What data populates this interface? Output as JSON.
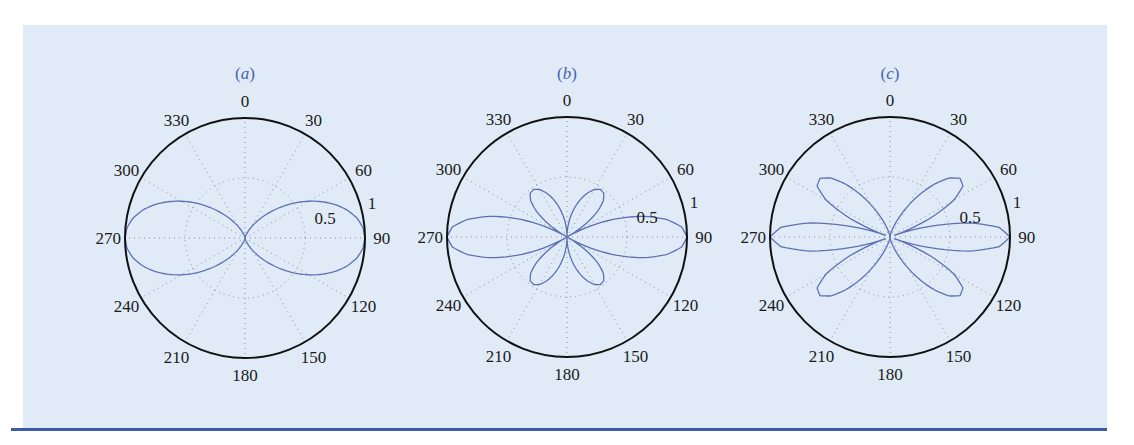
{
  "figure": {
    "background_color": "#e0ebf7",
    "rule_color": "#3f5ca3",
    "curve_color": "#5c70b4",
    "axis_color": "#111111",
    "grid_color": "#8a8f99"
  },
  "chart_data": [
    {
      "type": "polar",
      "title": "(a)",
      "title_letter": "a",
      "orientation": "compass (0 at top, clockwise)",
      "angle_ticks": [
        "0",
        "30",
        "60",
        "90",
        "120",
        "150",
        "180",
        "210",
        "240",
        "270",
        "300",
        "330"
      ],
      "radial_ticks": [
        "0.5",
        "1"
      ],
      "rlim": [
        0,
        1
      ],
      "grid": true,
      "theta_step_deg": 5,
      "theta_0_90": [
        0,
        5,
        10,
        15,
        20,
        25,
        30,
        35,
        40,
        45,
        50,
        55,
        60,
        65,
        70,
        75,
        80,
        85,
        90
      ],
      "r_0_90": [
        0,
        0.0005,
        0.0041,
        0.0138,
        0.0324,
        0.062,
        0.1045,
        0.1607,
        0.2309,
        0.314,
        0.4078,
        0.5096,
        0.6124,
        0.7139,
        0.8073,
        0.8872,
        0.9484,
        0.9868,
        1
      ],
      "symmetry": "r(180-θ)=r(θ), r(θ+180)=r(θ)"
    },
    {
      "type": "polar",
      "title": "(b)",
      "title_letter": "b",
      "orientation": "compass (0 at top, clockwise)",
      "angle_ticks": [
        "0",
        "30",
        "60",
        "90",
        "120",
        "150",
        "180",
        "210",
        "240",
        "270",
        "300",
        "330"
      ],
      "radial_ticks": [
        "0.5",
        "1"
      ],
      "rlim": [
        0,
        1
      ],
      "grid": true,
      "theta_step_deg": 5,
      "theta_0_90": [
        0,
        5,
        10,
        15,
        20,
        25,
        30,
        35,
        40,
        45,
        50,
        55,
        60,
        65,
        70,
        75,
        80,
        85,
        90
      ],
      "r_0_90": [
        0,
        0.0872,
        0.1731,
        0.2573,
        0.3359,
        0.4044,
        0.4563,
        0.4835,
        0.4768,
        0.4283,
        0.332,
        0.1878,
        0,
        0.2181,
        0.4479,
        0.6639,
        0.8419,
        0.959,
        1
      ],
      "symmetry": "r(180-θ)=r(θ), r(θ+180)=r(θ)"
    },
    {
      "type": "polar",
      "title": "(c)",
      "title_letter": "c",
      "orientation": "compass (0 at top, clockwise)",
      "angle_ticks": [
        "0",
        "30",
        "60",
        "90",
        "120",
        "150",
        "180",
        "210",
        "240",
        "270",
        "300",
        "330"
      ],
      "radial_ticks": [
        "0.5",
        "1"
      ],
      "rlim": [
        0,
        1
      ],
      "grid": true,
      "theta_step_deg": 5,
      "theta_0_90": [
        0,
        5,
        10,
        15,
        20,
        25,
        30,
        35,
        40,
        45,
        50,
        55,
        60,
        65,
        70,
        75,
        80,
        85,
        90
      ],
      "r_0_90": [
        0,
        0.0016,
        0.0124,
        0.0414,
        0.0959,
        0.1806,
        0.2951,
        0.4316,
        0.5738,
        0.6943,
        0.7612,
        0.7417,
        0.6124,
        0.3699,
        0.0383,
        0.3317,
        0.6731,
        0.9133,
        1
      ],
      "symmetry": "r(180-θ)=r(θ), r(θ+180)=r(θ)"
    }
  ],
  "layout": {
    "centers": [
      [
        245,
        238
      ],
      [
        567,
        237
      ],
      [
        890,
        237
      ]
    ],
    "radius": 120
  }
}
